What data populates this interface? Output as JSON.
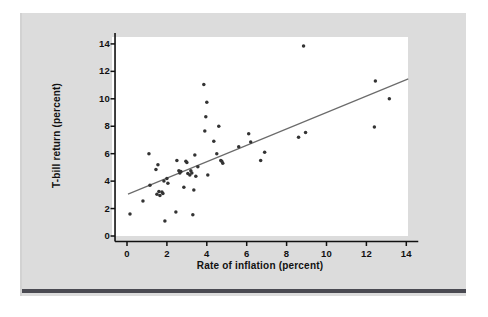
{
  "figure": {
    "panel_background": "#dcdcdc",
    "plot_background": "#ffffff",
    "rule_color": "#4a4a52",
    "point_color": "#333333",
    "line_color": "#6b6b6b",
    "axis_color": "#111111"
  },
  "chart_data": {
    "type": "scatter",
    "title": "",
    "xlabel": "Rate of inflation (percent)",
    "ylabel": "T-bill return (percent)",
    "xlim": [
      -0.6,
      14.6
    ],
    "ylim": [
      -0.4,
      14.8
    ],
    "xticks": [
      0,
      2,
      4,
      6,
      8,
      10,
      12,
      14
    ],
    "xtick_labels": [
      "0",
      "2",
      "4",
      "6",
      "8",
      "10",
      "12",
      "14"
    ],
    "yticks": [
      0,
      2,
      4,
      6,
      8,
      10,
      12,
      14
    ],
    "ytick_labels": [
      "0",
      "2",
      "4",
      "6",
      "8",
      "10",
      "12",
      "14"
    ],
    "grid": false,
    "legend": null,
    "marker": "filled-circle",
    "marker_size_px": 2.6,
    "points": [
      [
        0.15,
        1.6
      ],
      [
        0.8,
        2.55
      ],
      [
        1.1,
        6.0
      ],
      [
        1.15,
        3.7
      ],
      [
        1.45,
        4.85
      ],
      [
        1.5,
        3.05
      ],
      [
        1.55,
        5.2
      ],
      [
        1.6,
        3.25
      ],
      [
        1.65,
        2.95
      ],
      [
        1.75,
        3.2
      ],
      [
        1.8,
        3.1
      ],
      [
        1.85,
        4.0
      ],
      [
        1.9,
        1.1
      ],
      [
        2.0,
        4.2
      ],
      [
        2.05,
        3.85
      ],
      [
        2.45,
        1.75
      ],
      [
        2.5,
        5.5
      ],
      [
        2.6,
        4.75
      ],
      [
        2.65,
        4.6
      ],
      [
        2.7,
        4.7
      ],
      [
        2.85,
        3.55
      ],
      [
        2.95,
        5.45
      ],
      [
        3.0,
        5.35
      ],
      [
        3.05,
        4.55
      ],
      [
        3.15,
        4.45
      ],
      [
        3.2,
        4.75
      ],
      [
        3.25,
        4.6
      ],
      [
        3.3,
        1.55
      ],
      [
        3.35,
        3.35
      ],
      [
        3.4,
        5.9
      ],
      [
        3.45,
        4.35
      ],
      [
        3.55,
        5.05
      ],
      [
        3.85,
        11.05
      ],
      [
        3.9,
        7.65
      ],
      [
        3.95,
        8.7
      ],
      [
        4.0,
        9.75
      ],
      [
        4.05,
        4.45
      ],
      [
        4.35,
        6.9
      ],
      [
        4.5,
        6.0
      ],
      [
        4.6,
        8.0
      ],
      [
        4.7,
        5.5
      ],
      [
        4.75,
        5.45
      ],
      [
        4.8,
        5.3
      ],
      [
        5.6,
        6.5
      ],
      [
        6.1,
        7.45
      ],
      [
        6.2,
        6.85
      ],
      [
        6.7,
        5.5
      ],
      [
        6.9,
        6.1
      ],
      [
        8.6,
        7.2
      ],
      [
        8.85,
        13.85
      ],
      [
        8.95,
        7.55
      ],
      [
        12.4,
        7.95
      ],
      [
        12.45,
        11.3
      ],
      [
        13.15,
        10.0
      ]
    ],
    "fit_line": {
      "name": "least-squares regression line",
      "x_start": 0.05,
      "y_start": 3.05,
      "x_end": 14.1,
      "y_end": 11.45
    }
  }
}
